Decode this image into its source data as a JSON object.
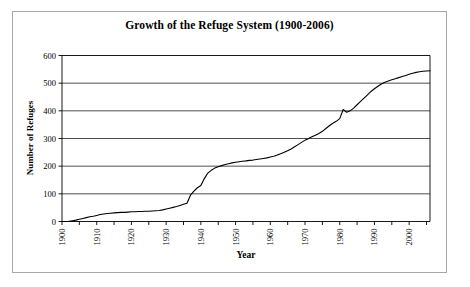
{
  "figure": {
    "background_color": "#ffffff",
    "frame_color": "#a8a8a8",
    "axis_color": "#000000",
    "grid_color": "#000000",
    "line_color": "#000000"
  },
  "chart_data": {
    "type": "line",
    "title": "Growth of the Refuge System (1900-2006)",
    "xlabel": "Year",
    "ylabel": "Number of Refuges",
    "xlim": [
      1900,
      2006
    ],
    "ylim": [
      0,
      600
    ],
    "yticks": [
      0,
      100,
      200,
      300,
      400,
      500,
      600
    ],
    "ytick_labels": [
      "0",
      "100",
      "200",
      "300",
      "400",
      "500",
      "600"
    ],
    "xticks": [
      1900,
      1905,
      1910,
      1915,
      1920,
      1925,
      1930,
      1935,
      1940,
      1945,
      1950,
      1955,
      1960,
      1965,
      1970,
      1975,
      1980,
      1985,
      1990,
      1995,
      2000,
      2005
    ],
    "xtick_labels": [
      "1900",
      "",
      "1910",
      "",
      "1920",
      "",
      "1930",
      "",
      "1940",
      "",
      "1950",
      "",
      "1960",
      "",
      "1970",
      "",
      "1980",
      "",
      "1990",
      "",
      "2000",
      ""
    ],
    "xtick_label_rotation": 90,
    "grid": true,
    "grid_axis": "y",
    "legend": false,
    "series": [
      {
        "name": "Number of Refuges",
        "x": [
          1900,
          1902,
          1903,
          1904,
          1905,
          1906,
          1907,
          1908,
          1909,
          1910,
          1911,
          1912,
          1913,
          1914,
          1915,
          1916,
          1917,
          1918,
          1919,
          1920,
          1921,
          1922,
          1923,
          1924,
          1925,
          1926,
          1927,
          1928,
          1929,
          1930,
          1931,
          1932,
          1933,
          1934,
          1935,
          1936,
          1937,
          1938,
          1939,
          1940,
          1941,
          1942,
          1943,
          1944,
          1945,
          1946,
          1947,
          1948,
          1949,
          1950,
          1951,
          1952,
          1953,
          1954,
          1955,
          1956,
          1957,
          1958,
          1959,
          1960,
          1961,
          1962,
          1963,
          1964,
          1965,
          1966,
          1967,
          1968,
          1969,
          1970,
          1971,
          1972,
          1973,
          1974,
          1975,
          1976,
          1977,
          1978,
          1979,
          1980,
          1981,
          1982,
          1983,
          1984,
          1985,
          1986,
          1987,
          1988,
          1989,
          1990,
          1991,
          1992,
          1993,
          1994,
          1995,
          1996,
          1997,
          1998,
          1999,
          2000,
          2001,
          2002,
          2003,
          2004,
          2005,
          2006
        ],
        "y": [
          0,
          1,
          3,
          5,
          8,
          11,
          14,
          17,
          19,
          22,
          25,
          27,
          29,
          30,
          31,
          32,
          33,
          33,
          34,
          35,
          35,
          36,
          36,
          37,
          37,
          38,
          39,
          40,
          42,
          45,
          48,
          51,
          54,
          58,
          62,
          66,
          95,
          110,
          122,
          130,
          155,
          175,
          185,
          193,
          198,
          202,
          206,
          209,
          212,
          214,
          216,
          218,
          219,
          221,
          222,
          224,
          226,
          228,
          230,
          233,
          236,
          240,
          245,
          250,
          256,
          262,
          270,
          278,
          286,
          294,
          300,
          306,
          312,
          318,
          326,
          336,
          346,
          355,
          362,
          372,
          405,
          395,
          400,
          410,
          422,
          434,
          446,
          458,
          470,
          480,
          489,
          497,
          503,
          508,
          512,
          516,
          520,
          524,
          528,
          532,
          536,
          539,
          541,
          543,
          544,
          545
        ],
        "color": "#000000",
        "linewidth": 1.1
      }
    ]
  },
  "icons": {
    "chart_type_icon": "line-chart-icon"
  }
}
